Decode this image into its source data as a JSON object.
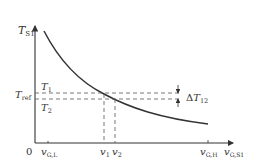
{
  "diagram": {
    "y_axis_label": {
      "main": "T",
      "sub": "S1"
    },
    "x_axis_label": {
      "main": "v",
      "sub": "G,S1"
    },
    "origin_label": "0",
    "ref_labels": {
      "t_ref": {
        "main": "T",
        "sub": "ref"
      },
      "t1": {
        "main": "T",
        "sub": "1"
      },
      "t2": {
        "main": "T",
        "sub": "2"
      }
    },
    "x_ticks": {
      "v_gl": {
        "main": "v",
        "sub": "G,L"
      },
      "v1": {
        "main": "v",
        "sub": "1"
      },
      "v2": {
        "main": "v",
        "sub": "2"
      },
      "v_gh": {
        "main": "v",
        "sub": "G,H"
      }
    },
    "delta_label": {
      "prefix": "Δ",
      "main": "T",
      "sub": "12"
    },
    "curve_description": "Decreasing convex curve of T_S1 versus v_G,S1",
    "colors": {
      "line": "#333333",
      "dash": "#555555"
    }
  }
}
